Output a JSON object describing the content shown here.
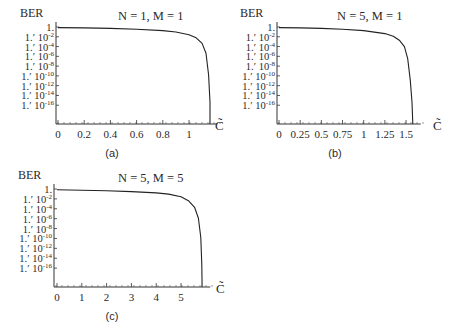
{
  "figure": {
    "captions": [
      "(a)",
      "(b)",
      "(c)"
    ]
  },
  "chart_data": [
    {
      "type": "line",
      "panel": "(a)",
      "title": "N = 1, M = 1",
      "ylabel": "BER",
      "xlabel": "C̃",
      "yscale": "log",
      "ytick_labels": [
        "1.",
        "1.′ 10^-2",
        "1.′ 10^-4",
        "1.′ 10^-6",
        "1.′ 10^-8",
        "1.′ 10^-10",
        "1.′ 10^-12",
        "1.′ 10^-14",
        "1.′ 10^-16"
      ],
      "xticks": [
        0,
        0.2,
        0.4,
        0.6,
        0.8,
        1
      ],
      "xtick_labels": [
        "0",
        "0.2",
        "0.4",
        "0.6",
        "0.8",
        "1"
      ],
      "xlim": [
        0,
        1.2
      ],
      "ylim_exp": [
        -18,
        0
      ],
      "grid": false,
      "x": [
        0,
        0.2,
        0.4,
        0.6,
        0.8,
        0.9,
        1.0,
        1.05,
        1.1,
        1.13,
        1.15,
        1.16,
        1.16
      ],
      "log10_ber": [
        -0.3,
        -0.35,
        -0.45,
        -0.6,
        -0.85,
        -1.1,
        -1.6,
        -2.1,
        -3.2,
        -5,
        -9,
        -14,
        -18
      ]
    },
    {
      "type": "line",
      "panel": "(b)",
      "title": "N = 5, M = 1",
      "ylabel": "BER",
      "xlabel": "C̃",
      "yscale": "log",
      "ytick_labels": [
        "1.",
        "1.′ 10^-2",
        "1.′ 10^-4",
        "1.′ 10^-6",
        "1.′ 10^-8",
        "1.′ 10^-10",
        "1.′ 10^-12",
        "1.′ 10^-14",
        "1.′ 10^-16"
      ],
      "xticks": [
        0,
        0.25,
        0.5,
        0.75,
        1,
        1.25,
        1.5
      ],
      "xtick_labels": [
        "0",
        "0.25",
        "0.5",
        "0.75",
        "1",
        "1.25",
        "1.5"
      ],
      "xlim": [
        0,
        1.65
      ],
      "ylim_exp": [
        -18,
        0
      ],
      "grid": false,
      "x": [
        0,
        0.25,
        0.5,
        0.75,
        1.0,
        1.25,
        1.35,
        1.42,
        1.48,
        1.52,
        1.55,
        1.57,
        1.58
      ],
      "log10_ber": [
        -0.3,
        -0.35,
        -0.45,
        -0.6,
        -0.85,
        -1.4,
        -1.9,
        -2.6,
        -3.8,
        -6,
        -10,
        -14,
        -18
      ]
    },
    {
      "type": "line",
      "panel": "(c)",
      "title": "N = 5, M = 5",
      "ylabel": "BER",
      "xlabel": "C̃",
      "yscale": "log",
      "ytick_labels": [
        "1.",
        "1.′ 10^-2",
        "1.′ 10^-4",
        "1.′ 10^-6",
        "1.′ 10^-8",
        "1.′ 10^-10",
        "1.′ 10^-12",
        "1.′ 10^-14",
        "1.′ 10^-16"
      ],
      "xticks": [
        0,
        1,
        2,
        3,
        4,
        5
      ],
      "xtick_labels": [
        "0",
        "1",
        "2",
        "3",
        "4",
        "5"
      ],
      "xlim": [
        0,
        6.1
      ],
      "ylim_exp": [
        -18,
        0
      ],
      "grid": false,
      "x": [
        0,
        1,
        2,
        3,
        4,
        4.5,
        5.0,
        5.3,
        5.55,
        5.7,
        5.8,
        5.84,
        5.85
      ],
      "log10_ber": [
        -0.3,
        -0.4,
        -0.5,
        -0.65,
        -0.9,
        -1.1,
        -1.6,
        -2.3,
        -3.5,
        -5.5,
        -9,
        -14,
        -18
      ]
    }
  ]
}
